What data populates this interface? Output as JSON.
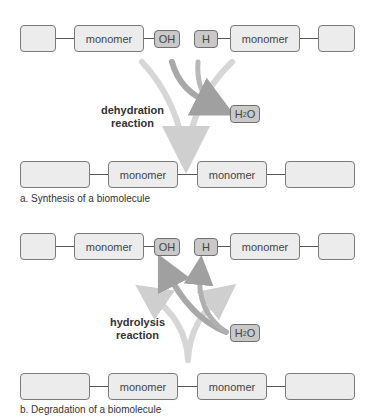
{
  "panel_a": {
    "top_chain": {
      "end_left": "",
      "monomer_left": "monomer",
      "oh_group": "OH",
      "h_group": "H",
      "monomer_right": "monomer",
      "end_right": ""
    },
    "reaction_label_line1": "dehydration",
    "reaction_label_line2": "reaction",
    "water_product": {
      "main": "H",
      "sub": "2",
      "tail": "O"
    },
    "bottom_chain": {
      "end_left": "",
      "monomer_left": "monomer",
      "monomer_right": "monomer",
      "end_right": ""
    },
    "caption": "a. Synthesis of a biomolecule"
  },
  "panel_b": {
    "top_chain": {
      "end_left": "",
      "monomer_left": "monomer",
      "oh_group": "OH",
      "h_group": "H",
      "monomer_right": "monomer",
      "end_right": ""
    },
    "reaction_label_line1": "hydrolysis",
    "reaction_label_line2": "reaction",
    "water_reactant": {
      "main": "H",
      "sub": "2",
      "tail": "O"
    },
    "bottom_chain": {
      "end_left": "",
      "monomer_left": "monomer",
      "monomer_right": "monomer",
      "end_right": ""
    },
    "caption": "b. Degradation of a biomolecule"
  },
  "colors": {
    "box_fill": "#ececec",
    "group_fill": "#c9c9c9",
    "arrow_light": "#d3d3d3",
    "arrow_dark": "#a6a6a6"
  }
}
